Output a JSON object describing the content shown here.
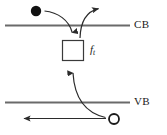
{
  "figure": {
    "kind": "semiconductor-band-diagram",
    "width": 167,
    "height": 135,
    "background_color": "#ffffff",
    "line_color": "#5a5a5a",
    "arrow_color": "#2b2b2b",
    "text_color": "#1a1a1a"
  },
  "labels": {
    "conduction_band": "CB",
    "valence_band": "VB",
    "trap_level_main": "f",
    "trap_level_subscript": "t"
  },
  "bands": [
    {
      "name": "conduction-band",
      "label": "CB",
      "y": 25,
      "x_start": 5,
      "x_end": 130
    },
    {
      "name": "valence-band",
      "label": "VB",
      "y": 102,
      "x_start": 5,
      "x_end": 130
    }
  ],
  "particles": [
    {
      "name": "electron",
      "style": "filled-circle",
      "cx": 36,
      "cy": 11,
      "r": 5.2
    },
    {
      "name": "hole",
      "style": "open-circle",
      "cx": 114,
      "cy": 119,
      "r": 5.2
    }
  ],
  "trap_box": {
    "name": "trap-state-box",
    "x": 62,
    "y": 40,
    "width": 22,
    "height": 21
  },
  "arrows": [
    {
      "name": "electron-capture-arrow",
      "description": "curve from electron down into trap box",
      "direction": "down"
    },
    {
      "name": "electron-emission-arrow",
      "description": "curve from trap box up and to the right above CB",
      "direction": "right"
    },
    {
      "name": "hole-capture-arrow",
      "description": "curve from hole up into trap box",
      "direction": "up"
    },
    {
      "name": "hole-transport-arrow",
      "description": "straight horizontal arrow below VB pointing left",
      "direction": "left"
    }
  ]
}
